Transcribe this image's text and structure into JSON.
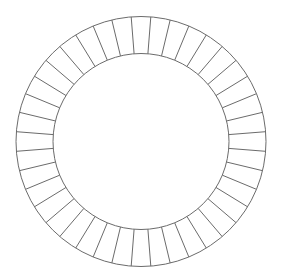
{
  "diagram": {
    "type": "segmented-ring",
    "canvas": {
      "width": 282,
      "height": 276,
      "background": "#ffffff"
    },
    "center": {
      "x": 141,
      "y": 141.5
    },
    "outer_radius": 125,
    "inner_radius": 88,
    "segment_count": 40,
    "start_angle_offset_deg": 4.5,
    "stroke_color": "#6b6b6b",
    "stroke_width": 1
  }
}
